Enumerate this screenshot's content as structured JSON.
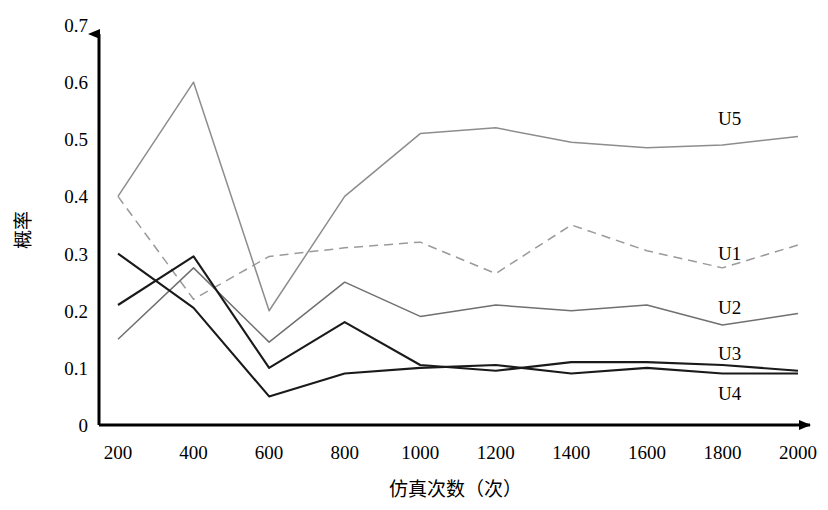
{
  "chart_data": {
    "type": "line",
    "title": "",
    "xlabel": "仿真次数（次）",
    "ylabel": "概率",
    "x": [
      200,
      400,
      600,
      800,
      1000,
      1200,
      1400,
      1600,
      1800,
      2000
    ],
    "xlim": [
      200,
      2000
    ],
    "ylim": [
      0,
      0.7
    ],
    "ytick_labels": [
      "0",
      "0.1",
      "0.2",
      "0.3",
      "0.4",
      "0.5",
      "0.6",
      "0.7"
    ],
    "ytick_values": [
      0,
      0.1,
      0.2,
      0.3,
      0.4,
      0.5,
      0.6,
      0.7
    ],
    "xtick_labels": [
      "200",
      "400",
      "600",
      "800",
      "1000",
      "1200",
      "1400",
      "1600",
      "1800",
      "2000"
    ],
    "grid": false,
    "legend": "inline-right-end-labels",
    "series": [
      {
        "name": "U1",
        "values": [
          0.4,
          0.22,
          0.295,
          0.31,
          0.32,
          0.265,
          0.35,
          0.305,
          0.275,
          0.315
        ],
        "style": "dashed",
        "color": "#9a9a9a",
        "label_x": 2000,
        "label_y": 0.3
      },
      {
        "name": "U2",
        "values": [
          0.15,
          0.275,
          0.145,
          0.25,
          0.19,
          0.21,
          0.2,
          0.21,
          0.175,
          0.195
        ],
        "style": "solid",
        "color": "#707070",
        "label_x": 2000,
        "label_y": 0.205
      },
      {
        "name": "U3",
        "values": [
          0.21,
          0.295,
          0.1,
          0.18,
          0.105,
          0.095,
          0.11,
          0.11,
          0.105,
          0.095
        ],
        "style": "solid",
        "color": "#1a1a1a",
        "label_x": 2000,
        "label_y": 0.125
      },
      {
        "name": "U4",
        "values": [
          0.3,
          0.205,
          0.05,
          0.09,
          0.1,
          0.105,
          0.09,
          0.1,
          0.09,
          0.09
        ],
        "style": "solid",
        "color": "#1a1a1a",
        "label_x": 2000,
        "label_y": 0.055
      },
      {
        "name": "U5",
        "values": [
          0.4,
          0.6,
          0.2,
          0.4,
          0.51,
          0.52,
          0.495,
          0.485,
          0.49,
          0.505
        ],
        "style": "solid",
        "color": "#8d8d8d",
        "label_x": 2000,
        "label_y": 0.535
      }
    ]
  },
  "axes": {
    "y_axis_name": "y-axis",
    "x_axis_name": "x-axis"
  }
}
